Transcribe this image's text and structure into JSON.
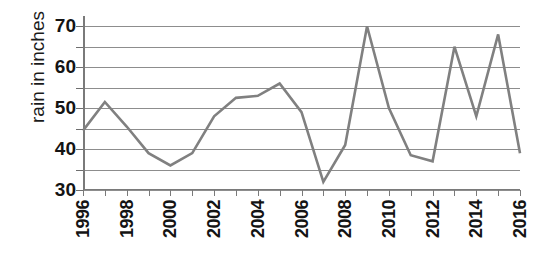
{
  "chart_data": {
    "type": "line",
    "title": "",
    "xlabel": "",
    "ylabel": "rain in inches",
    "x": [
      1996,
      1997,
      1998,
      1999,
      2000,
      2001,
      2002,
      2003,
      2004,
      2005,
      2006,
      2007,
      2008,
      2009,
      2010,
      2011,
      2012,
      2013,
      2014,
      2015,
      2016
    ],
    "values": [
      44.5,
      51.5,
      45.5,
      39,
      36,
      39,
      48,
      52.5,
      53,
      56,
      49,
      32,
      41,
      70,
      50,
      38.5,
      37,
      65,
      48,
      68,
      39
    ],
    "series": [
      {
        "name": "rain in inches",
        "values": [
          44.5,
          51.5,
          45.5,
          39,
          36,
          39,
          48,
          52.5,
          53,
          56,
          49,
          32,
          41,
          70,
          50,
          38.5,
          37,
          65,
          48,
          68,
          39
        ]
      }
    ],
    "ylim": [
      30,
      72.5
    ],
    "xlim": [
      1996,
      2016
    ],
    "y_ticks": [
      30,
      35,
      40,
      45,
      50,
      55,
      60,
      65,
      70
    ],
    "y_tick_labels": [
      "30",
      "40",
      "50",
      "60",
      "70"
    ],
    "y_labeled_ticks": [
      30,
      40,
      50,
      60,
      70
    ],
    "x_tick_labels": [
      "1996",
      "1998",
      "2000",
      "2002",
      "2004",
      "2006",
      "2008",
      "2010",
      "2012",
      "2014",
      "2016"
    ],
    "x_labeled_ticks": [
      1996,
      1998,
      2000,
      2002,
      2004,
      2006,
      2008,
      2010,
      2012,
      2014,
      2016
    ],
    "grid": true,
    "grid_orientation": "horizontal",
    "legend": false,
    "legend_position": "none",
    "line_color": "#808080",
    "grid_color": "#8d8d8d",
    "axis_color": "#7a7a7a",
    "background_color": "#ffffff",
    "markers": false,
    "line_width": 2.6
  },
  "axis": {
    "y_title": "rain in inches"
  }
}
